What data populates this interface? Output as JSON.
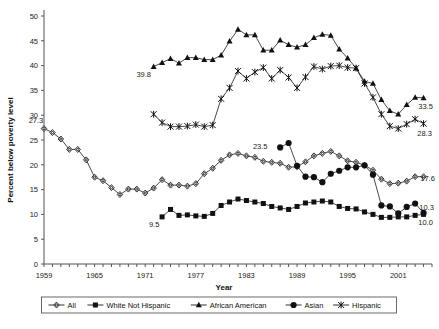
{
  "chart_data": {
    "type": "line",
    "title": "",
    "xlabel": "Year",
    "ylabel": "Percent below poverty level",
    "xlim": [
      1959,
      2005
    ],
    "ylim": [
      0,
      50
    ],
    "ytick_step": 5,
    "yticks": [
      0,
      5,
      10,
      15,
      20,
      25,
      30,
      35,
      40,
      45,
      50
    ],
    "xticks": [
      1959,
      1965,
      1971,
      1977,
      1983,
      1989,
      1995,
      2001
    ],
    "xtick_labels": [
      "1959",
      "1965",
      "1971",
      "1977",
      "1983",
      "1989",
      "1995",
      "2001"
    ],
    "grid": false,
    "legend_position": "bottom",
    "series": [
      {
        "name": "All",
        "marker": "diamond-open",
        "x": [
          1959,
          1960,
          1961,
          1962,
          1963,
          1964,
          1965,
          1966,
          1967,
          1968,
          1969,
          1970,
          1971,
          1972,
          1973,
          1974,
          1975,
          1976,
          1977,
          1978,
          1979,
          1980,
          1981,
          1982,
          1983,
          1984,
          1985,
          1986,
          1987,
          1988,
          1989,
          1990,
          1991,
          1992,
          1993,
          1994,
          1995,
          1996,
          1997,
          1998,
          1999,
          2000,
          2001,
          2002,
          2003,
          2004
        ],
        "values": [
          27.3,
          26.5,
          25.2,
          23.1,
          23.1,
          21.0,
          17.5,
          16.8,
          15.4,
          14.0,
          15.1,
          15.1,
          14.3,
          15.3,
          17.0,
          15.9,
          15.9,
          15.7,
          16.2,
          18.2,
          19.3,
          20.9,
          22.0,
          22.3,
          21.8,
          21.5,
          20.7,
          20.5,
          20.3,
          19.5,
          19.6,
          20.6,
          21.8,
          22.3,
          22.7,
          21.8,
          20.8,
          20.5,
          19.9,
          18.9,
          17.1,
          16.2,
          16.3,
          16.7,
          17.6,
          17.6
        ]
      },
      {
        "name": "White Not Hispanic",
        "marker": "square-filled",
        "x": [
          1973,
          1974,
          1975,
          1976,
          1977,
          1978,
          1979,
          1980,
          1981,
          1982,
          1983,
          1984,
          1985,
          1986,
          1987,
          1988,
          1989,
          1990,
          1991,
          1992,
          1993,
          1994,
          1995,
          1996,
          1997,
          1998,
          1999,
          2000,
          2001,
          2002,
          2003,
          2004
        ],
        "values": [
          9.5,
          11.0,
          9.8,
          9.9,
          9.7,
          9.6,
          10.2,
          11.8,
          12.5,
          13.1,
          12.8,
          12.5,
          12.2,
          11.6,
          11.3,
          11.0,
          11.6,
          12.3,
          12.5,
          12.7,
          12.5,
          11.6,
          11.2,
          11.1,
          10.5,
          10.0,
          9.4,
          9.4,
          9.5,
          9.5,
          9.8,
          10.0
        ]
      },
      {
        "name": "African American",
        "marker": "triangle-filled",
        "x": [
          1972,
          1973,
          1974,
          1975,
          1976,
          1977,
          1978,
          1979,
          1980,
          1981,
          1982,
          1983,
          1984,
          1985,
          1986,
          1987,
          1988,
          1989,
          1990,
          1991,
          1992,
          1993,
          1994,
          1995,
          1996,
          1997,
          1998,
          1999,
          2000,
          2001,
          2002,
          2003,
          2004
        ],
        "values": [
          39.8,
          40.6,
          41.4,
          40.5,
          41.6,
          41.6,
          41.2,
          41.2,
          42.1,
          44.9,
          47.3,
          46.2,
          46.2,
          43.1,
          43.1,
          45.1,
          44.2,
          43.7,
          44.2,
          45.6,
          46.3,
          46.1,
          43.3,
          41.5,
          39.5,
          36.8,
          36.4,
          33.1,
          30.9,
          30.2,
          32.1,
          33.6,
          33.5
        ]
      },
      {
        "name": "Asian",
        "marker": "circle-filled",
        "x": [
          1987,
          1988,
          1989,
          1990,
          1991,
          1992,
          1993,
          1994,
          1995,
          1996,
          1997,
          1998,
          1999,
          2000,
          2001,
          2002,
          2003,
          2004
        ],
        "values": [
          23.5,
          24.4,
          19.8,
          17.6,
          17.5,
          16.5,
          18.2,
          18.8,
          19.5,
          19.5,
          19.9,
          18.0,
          11.8,
          11.6,
          10.2,
          11.5,
          12.2,
          10.3
        ]
      },
      {
        "name": "Hispanic",
        "marker": "star-x",
        "x": [
          1972,
          1973,
          1974,
          1975,
          1976,
          1977,
          1978,
          1979,
          1980,
          1981,
          1982,
          1983,
          1984,
          1985,
          1986,
          1987,
          1988,
          1989,
          1990,
          1991,
          1992,
          1993,
          1994,
          1995,
          1996,
          1997,
          1998,
          1999,
          2000,
          2001,
          2002,
          2003,
          2004
        ],
        "values": [
          30.2,
          28.5,
          27.7,
          27.7,
          27.8,
          28.1,
          27.7,
          28.0,
          33.3,
          35.5,
          38.9,
          37.4,
          38.7,
          39.6,
          37.4,
          39.1,
          37.6,
          35.5,
          37.7,
          39.8,
          39.3,
          39.9,
          40.0,
          39.6,
          39.5,
          36.4,
          33.6,
          30.2,
          27.8,
          27.3,
          28.2,
          29.2,
          28.3
        ]
      }
    ],
    "annotations": [
      {
        "text": "27.3",
        "series": "All",
        "x": 1959,
        "y": 27.3,
        "dx": -8,
        "dy": -6
      },
      {
        "text": "17.6",
        "series": "All",
        "x": 2004,
        "y": 17.6,
        "dx": 4,
        "dy": 4
      },
      {
        "text": "9.5",
        "series": "White Not Hispanic",
        "x": 1973,
        "y": 9.5,
        "dx": -8,
        "dy": 10
      },
      {
        "text": "10.0",
        "series": "White Not Hispanic",
        "x": 2004,
        "y": 10.0,
        "dx": 2,
        "dy": 11
      },
      {
        "text": "39.8",
        "series": "African American",
        "x": 1972,
        "y": 39.8,
        "dx": -10,
        "dy": 10
      },
      {
        "text": "33.5",
        "series": "African American",
        "x": 2004,
        "y": 33.5,
        "dx": 2,
        "dy": 11
      },
      {
        "text": "23.5",
        "series": "Asian",
        "x": 1987,
        "y": 23.5,
        "dx": -20,
        "dy": 2
      },
      {
        "text": "10.3",
        "series": "Asian",
        "x": 2004,
        "y": 10.3,
        "dx": 3,
        "dy": -3
      },
      {
        "text": "28.3",
        "series": "Hispanic",
        "x": 2004,
        "y": 28.3,
        "dx": 1,
        "dy": 12
      }
    ],
    "legend": [
      {
        "label": "All",
        "marker": "diamond-open"
      },
      {
        "label": "White Not Hispanic",
        "marker": "square-filled"
      },
      {
        "label": "African American",
        "marker": "triangle-filled"
      },
      {
        "label": "Asian",
        "marker": "circle-filled"
      },
      {
        "label": "Hispanic",
        "marker": "star-x"
      }
    ],
    "colors": {
      "line": "#1a1a1a",
      "axis": "#555555",
      "text": "#222222",
      "background": "#ffffff"
    }
  }
}
